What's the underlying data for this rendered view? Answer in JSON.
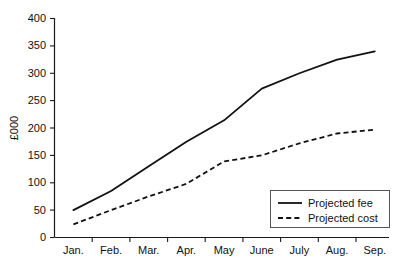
{
  "chart_data": {
    "type": "line",
    "title": "",
    "subtitle": "",
    "xlabel": "",
    "ylabel": "£000",
    "categories": [
      "Jan.",
      "Feb.",
      "Mar.",
      "Apr.",
      "May",
      "June",
      "July",
      "Aug.",
      "Sep."
    ],
    "series": [
      {
        "name": "Projected fee",
        "style": "solid",
        "values": [
          50,
          85,
          130,
          175,
          214,
          272,
          300,
          325,
          340
        ]
      },
      {
        "name": "Projected cost",
        "style": "dashed",
        "values": [
          24,
          50,
          75,
          98,
          139,
          150,
          172,
          190,
          197
        ]
      }
    ],
    "ylim": [
      0,
      400
    ],
    "yticks": [
      0,
      50,
      100,
      150,
      200,
      250,
      300,
      350,
      400
    ],
    "ytick_labels": [
      "0",
      "50",
      "100",
      "150",
      "200",
      "250",
      "300",
      "350",
      "400"
    ],
    "grid": false,
    "legend_position": "bottom-right",
    "colors": {
      "line": "#111111",
      "axis": "#1a1a1a",
      "background": "#ffffff",
      "legend_border": "#555555"
    }
  },
  "axes": {
    "y_title": "£000",
    "y_tick_labels": [
      "400",
      "350",
      "300",
      "250",
      "200",
      "150",
      "100",
      "50",
      "0"
    ],
    "x_tick_labels": [
      "Jan.",
      "Feb.",
      "Mar.",
      "Apr.",
      "May",
      "June",
      "July",
      "Aug.",
      "Sep."
    ]
  },
  "legend": {
    "entries": [
      {
        "label": "Projected fee",
        "style": "solid"
      },
      {
        "label": "Projected cost",
        "style": "dashed"
      }
    ]
  }
}
